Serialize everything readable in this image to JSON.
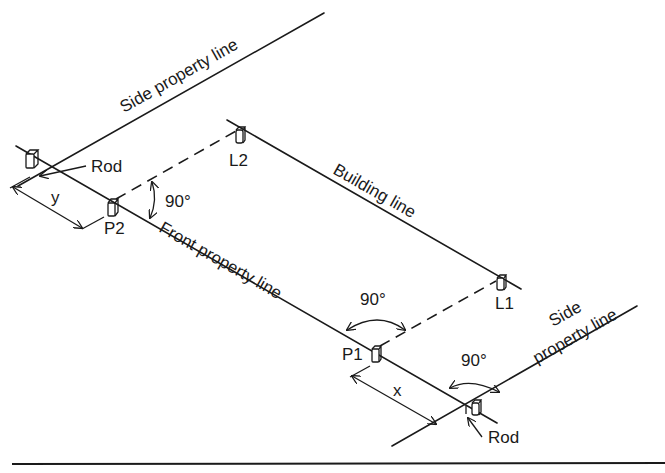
{
  "diagram": {
    "labels": {
      "side_property_line_top": "Side property line",
      "side_property_line_bottom_1": "Side",
      "side_property_line_bottom_2": "property line",
      "front_property_line": "Front property line",
      "building_line": "Building line",
      "rod_top": "Rod",
      "rod_bottom": "Rod",
      "stake_L1": "L1",
      "stake_L2": "L2",
      "stake_P1": "P1",
      "stake_P2": "P2",
      "dim_y": "y",
      "dim_x": "x",
      "angle_P2": "90°",
      "angle_P1": "90°",
      "angle_rod": "90°"
    },
    "colors": {
      "ink": "#1a1a1a",
      "background": "#ffffff"
    }
  }
}
